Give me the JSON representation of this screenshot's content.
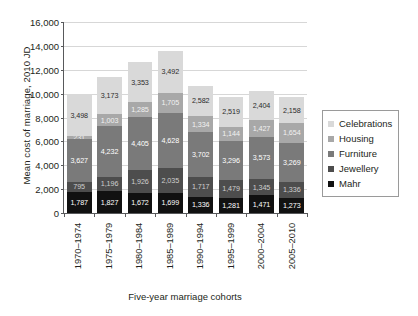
{
  "chart_data": {
    "type": "bar",
    "stacked": true,
    "title": "",
    "xlabel": "Five-year marriage cohorts",
    "ylabel": "Mean cost of marriage, 2010 JD",
    "ylim": [
      0,
      16000
    ],
    "ytick_labels": [
      "16,000",
      "14,000",
      "12,000",
      "10,000",
      "8,000",
      "6,000",
      "4,000",
      "2,000",
      "0"
    ],
    "ytick_values": [
      16000,
      14000,
      12000,
      10000,
      8000,
      6000,
      4000,
      2000,
      0
    ],
    "grid": true,
    "legend_position": "right",
    "categories": [
      "1970–1974",
      "1975–1979",
      "1980–1984",
      "1985–1989",
      "1990–1994",
      "1995–1999",
      "2000–2004",
      "2005–2010"
    ],
    "series": [
      {
        "name": "Celebrations",
        "color": "#d9d9d9",
        "values": [
          3498,
          3173,
          3353,
          3492,
          2582,
          2519,
          2404,
          2158
        ],
        "labels": [
          "3,498",
          "3,173",
          "3,353",
          "3,492",
          "2,582",
          "2,519",
          "2,404",
          "2,158"
        ]
      },
      {
        "name": "Housing",
        "color": "#a8a8a8",
        "values": [
          231,
          1003,
          1285,
          1705,
          1334,
          1144,
          1427,
          1654
        ],
        "labels": [
          "231",
          "1,003",
          "1,285",
          "1,705",
          "1,334",
          "1,144",
          "1,427",
          "1,654"
        ]
      },
      {
        "name": "Furniture",
        "color": "#7a7a7a",
        "values": [
          3627,
          4232,
          4405,
          4628,
          3702,
          3296,
          3573,
          3269
        ],
        "labels": [
          "3,627",
          "4,232",
          "4,405",
          "4,628",
          "3,702",
          "3,296",
          "3,573",
          "3,269"
        ]
      },
      {
        "name": "Jewellery",
        "color": "#4d4d4d",
        "values": [
          795,
          1196,
          1926,
          2035,
          1717,
          1479,
          1345,
          1336
        ],
        "labels": [
          "795",
          "1,196",
          "1,926",
          "2,035",
          "1,717",
          "1,479",
          "1,345",
          "1,336"
        ]
      },
      {
        "name": "Mahr",
        "color": "#111111",
        "values": [
          1787,
          1827,
          1672,
          1699,
          1336,
          1281,
          1471,
          1273
        ],
        "labels": [
          "1,787",
          "1,827",
          "1,672",
          "1,699",
          "1,336",
          "1,281",
          "1,471",
          "1,273"
        ]
      }
    ],
    "totals": [
      9938,
      11431,
      12641,
      13559,
      10671,
      9719,
      10220,
      9690
    ]
  }
}
